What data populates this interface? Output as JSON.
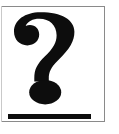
{
  "image": {
    "kind": "placeholder-graphic",
    "alt_text": "?",
    "width": 119,
    "height": 134,
    "background_color": "#ffffff"
  },
  "frame": {
    "border_color": "#8a8a8a",
    "left_edge_color": "#c9c9c9",
    "border_width": 1,
    "top_y": 6,
    "bottom_y": 121,
    "right_x": 104,
    "left_x": 1
  },
  "symbol": {
    "character": "?",
    "name": "question-mark",
    "color": "#0d0d0d",
    "hook": {
      "name": "question-mark-hook",
      "x": 14,
      "y": 12,
      "width": 66,
      "height": 66
    },
    "dot": {
      "name": "question-mark-dot",
      "shape": "ellipse",
      "center_x": 45,
      "center_y": 92,
      "radius_x": 16,
      "radius_y": 12,
      "color": "#0d0d0d"
    }
  },
  "underline": {
    "name": "underline-bar",
    "color": "#0d0d0d",
    "x": 8,
    "y": 114,
    "width": 83,
    "height": 5
  }
}
